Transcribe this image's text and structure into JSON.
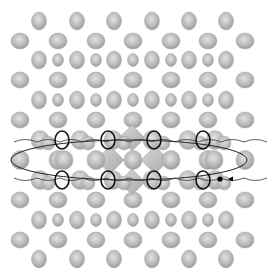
{
  "figure": {
    "background": "#ffffff",
    "atom_color": "#b8b8b8",
    "atom_edge": "#9a9a9a",
    "highlight_ring_color": "#111111",
    "path_color": "#222222",
    "diamond_color": "#c4c4c4"
  },
  "lattice": {
    "rows": [
      {
        "y": 21,
        "type": "big",
        "xs": [
          39,
          77,
          114,
          152,
          189,
          226
        ]
      },
      {
        "y": 41,
        "type": "wide",
        "xs": [
          20,
          58,
          96,
          133,
          171,
          208,
          245
        ]
      },
      {
        "y": 60,
        "type": "alt",
        "xs": [
          39,
          58,
          77,
          96,
          114,
          133,
          152,
          171,
          189,
          208,
          226
        ]
      },
      {
        "y": 80,
        "type": "wide",
        "xs": [
          20,
          58,
          96,
          133,
          171,
          208,
          245
        ]
      },
      {
        "y": 100,
        "type": "alt",
        "xs": [
          39,
          58,
          77,
          96,
          114,
          133,
          152,
          171,
          189,
          208,
          226
        ]
      },
      {
        "y": 120,
        "type": "wide",
        "xs": [
          20,
          58,
          96,
          133,
          171,
          208,
          245
        ]
      },
      {
        "y": 200,
        "type": "wide",
        "xs": [
          20,
          58,
          96,
          133,
          171,
          208,
          245
        ]
      },
      {
        "y": 220,
        "type": "alt",
        "xs": [
          39,
          58,
          77,
          96,
          114,
          133,
          152,
          171,
          189,
          208,
          226
        ]
      },
      {
        "y": 240,
        "type": "wide",
        "xs": [
          20,
          58,
          96,
          133,
          171,
          208,
          245
        ]
      },
      {
        "y": 259,
        "type": "big",
        "xs": [
          39,
          77,
          114,
          152,
          189,
          226
        ]
      }
    ],
    "band": {
      "top_y": 140,
      "mid_y": 160,
      "bottom_y": 180,
      "top_atoms": [
        40,
        48,
        80,
        88,
        113,
        124,
        152,
        163,
        188,
        200,
        215,
        224
      ],
      "mid_atoms": [
        20,
        58,
        64,
        96,
        133,
        171,
        208,
        214,
        245
      ],
      "bottom_atoms": [
        40,
        48,
        80,
        88,
        113,
        124,
        152,
        163,
        188,
        200,
        215,
        224
      ],
      "rings_top": [
        62,
        108,
        154,
        203
      ],
      "rings_bottom": [
        62,
        108,
        154,
        203
      ],
      "diamonds": [
        {
          "cx": 132,
          "cy": 138,
          "r": 13
        },
        {
          "cx": 110,
          "cy": 160,
          "r": 14
        },
        {
          "cx": 155,
          "cy": 160,
          "r": 14
        },
        {
          "cx": 132,
          "cy": 182,
          "r": 13
        }
      ]
    },
    "ellipse": {
      "cx": 129,
      "cy": 160,
      "rx": 118,
      "ry": 20
    },
    "marker": {
      "x": 220,
      "y": 179,
      "label": "start-point"
    }
  }
}
